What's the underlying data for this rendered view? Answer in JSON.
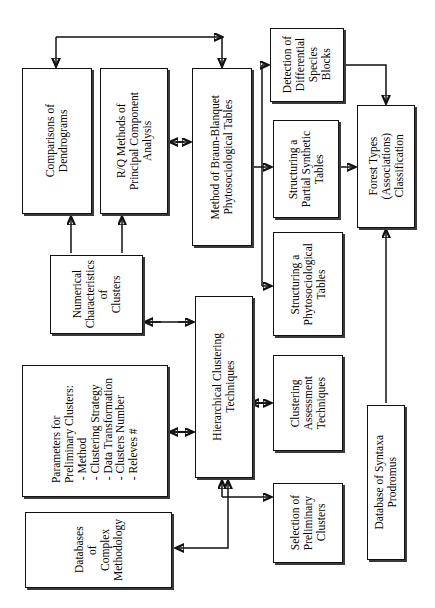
{
  "diagram": {
    "orientation": "rotated-90-landscape",
    "colors": {
      "box_border": "#111111",
      "background": "#ffffff",
      "shadow": "#3a3a3a"
    },
    "nodes": [
      {
        "id": "comparisons_of_dendrograms",
        "label": "Comparisons of\nDendrograms",
        "x": 22,
        "y": 68,
        "w": 70,
        "h": 146,
        "font": 11.5
      },
      {
        "id": "rq_methods_pca",
        "label": "R/Q Methods of\nPrincipal Component\nAnalysis",
        "x": 100,
        "y": 68,
        "w": 68,
        "h": 146,
        "font": 11.5
      },
      {
        "id": "method_braun_blanquet",
        "label": "Method of Braun-Blanquet\nPhytosociological Tables",
        "x": 192,
        "y": 68,
        "w": 60,
        "h": 178,
        "font": 11.5
      },
      {
        "id": "detection_differential_species_blocks",
        "label": "Detection of\nDifferential\nSpecies\nBlocks",
        "x": 270,
        "y": 28,
        "w": 74,
        "h": 74,
        "font": 11.5
      },
      {
        "id": "structuring_partial_synthetic_tables",
        "label": "Structuring a\nPartial Synthetic\nTables",
        "x": 273,
        "y": 120,
        "w": 66,
        "h": 98,
        "font": 11.5
      },
      {
        "id": "structuring_phytosociological_tables",
        "label": "Structuring a\nPhytosociological\nTables",
        "x": 273,
        "y": 232,
        "w": 70,
        "h": 104,
        "font": 11.5
      },
      {
        "id": "forest_types_classification",
        "label": "Forest Types\n(Associations)\nClassification",
        "x": 357,
        "y": 105,
        "w": 58,
        "h": 123,
        "font": 11.5
      },
      {
        "id": "numerical_characteristics_clusters",
        "label": "Numerical\nCharacteristics\nof\nClusters",
        "x": 50,
        "y": 255,
        "w": 93,
        "h": 79,
        "font": 11.5
      },
      {
        "id": "hierarchical_clustering_techniques",
        "label": "Hierarchical Clustering\nTechniques",
        "x": 195,
        "y": 296,
        "w": 58,
        "h": 182,
        "font": 11.5
      },
      {
        "id": "clustering_assessment_techniques",
        "label": "Clustering\nAssessment\nTechniques",
        "x": 273,
        "y": 355,
        "w": 70,
        "h": 96,
        "font": 11.5
      },
      {
        "id": "parameters_preliminary_clusters",
        "label": "Parameters for\nPreliminary Clusters:\n - Method\n - Clustering Strategy\n - Data Transformation\n - Clusters Number\n - Releves #",
        "x": 22,
        "y": 365,
        "w": 146,
        "h": 132,
        "font": 11.5,
        "align": "left"
      },
      {
        "id": "selection_preliminary_clusters",
        "label": "Selection of\nPreliminary\nClusters",
        "x": 273,
        "y": 483,
        "w": 70,
        "h": 80,
        "font": 11.5
      },
      {
        "id": "databases_complex_methodology",
        "label": "Databases\nof\nComplex\nMethodology",
        "x": 25,
        "y": 512,
        "w": 147,
        "h": 76,
        "font": 11.5
      },
      {
        "id": "database_syntaxa_prodromus",
        "label": "Database of Syntaxa\nProdromus",
        "x": 367,
        "y": 405,
        "w": 38,
        "h": 155,
        "font": 11.5
      }
    ],
    "edges": [
      {
        "id": "braun-to-comparisons-and-self",
        "from": "method_braun_blanquet",
        "to": "comparisons_of_dendrograms",
        "style": "orthogonal-double-arrow"
      },
      {
        "id": "rq-to-braun",
        "from": "rq_methods_pca",
        "to": "method_braun_blanquet",
        "style": "double-arrow"
      },
      {
        "id": "numchar-to-comparisons",
        "from": "numerical_characteristics_clusters",
        "to": "comparisons_of_dendrograms",
        "style": "arrow"
      },
      {
        "id": "numchar-to-rq",
        "from": "numerical_characteristics_clusters",
        "to": "rq_methods_pca",
        "style": "arrow"
      },
      {
        "id": "numchar-to-hierarchical",
        "from": "numerical_characteristics_clusters",
        "to": "hierarchical_clustering_techniques",
        "style": "double-arrow"
      },
      {
        "id": "params-to-hierarchical",
        "from": "parameters_preliminary_clusters",
        "to": "hierarchical_clustering_techniques",
        "style": "double-arrow"
      },
      {
        "id": "hierarchical-to-clustering-assessment",
        "from": "hierarchical_clustering_techniques",
        "to": "clustering_assessment_techniques",
        "style": "double-arrow"
      },
      {
        "id": "hierarchical-to-selection",
        "from": "hierarchical_clustering_techniques",
        "to": "selection_preliminary_clusters",
        "style": "arrow"
      },
      {
        "id": "databases-to-hierarchical",
        "from": "databases_complex_methodology",
        "to": "hierarchical_clustering_techniques",
        "style": "arrow"
      },
      {
        "id": "braun-to-detection",
        "from": "method_braun_blanquet",
        "to": "detection_differential_species_blocks",
        "style": "arrow"
      },
      {
        "id": "braun-to-partial-synthetic",
        "from": "method_braun_blanquet",
        "to": "structuring_partial_synthetic_tables",
        "style": "arrow"
      },
      {
        "id": "braun-to-phytosociological",
        "from": "method_braun_blanquet",
        "to": "structuring_phytosociological_tables",
        "style": "arrow"
      },
      {
        "id": "detection-to-forest-types",
        "from": "detection_differential_species_blocks",
        "to": "forest_types_classification",
        "style": "arrow"
      },
      {
        "id": "partial-synthetic-to-forest-types",
        "from": "structuring_partial_synthetic_tables",
        "to": "forest_types_classification",
        "style": "arrow"
      },
      {
        "id": "syntaxa-to-forest-types",
        "from": "database_syntaxa_prodromus",
        "to": "forest_types_classification",
        "style": "arrow"
      }
    ]
  }
}
